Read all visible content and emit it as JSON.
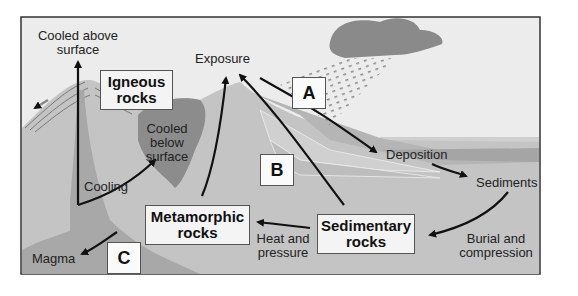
{
  "diagram": {
    "boxes": {
      "igneous": {
        "line1": "Igneous",
        "line2": "rocks"
      },
      "metamorphic": {
        "line1": "Metamorphic",
        "line2": "rocks"
      },
      "sedimentary": {
        "line1": "Sedimentary",
        "line2": "rocks"
      }
    },
    "letters": {
      "a": "A",
      "b": "B",
      "c": "C"
    },
    "labels": {
      "cooled_above_1": "Cooled above",
      "cooled_above_2": "surface",
      "exposure": "Exposure",
      "cooled_below_1": "Cooled",
      "cooled_below_2": "below",
      "cooled_below_3": "surface",
      "cooling": "Cooling",
      "magma": "Magma",
      "heat_1": "Heat and",
      "heat_2": "pressure",
      "deposition": "Deposition",
      "sediments": "Sediments",
      "burial_1": "Burial and",
      "burial_2": "compression"
    },
    "colors": {
      "sky": "#ececec",
      "ground": "#c4c4c4",
      "magma": "#a8a8a8",
      "intrusion": "#8c8c8c",
      "cloud": "#8a8a8a",
      "arrow": "#111111",
      "frame": "#333333"
    }
  }
}
